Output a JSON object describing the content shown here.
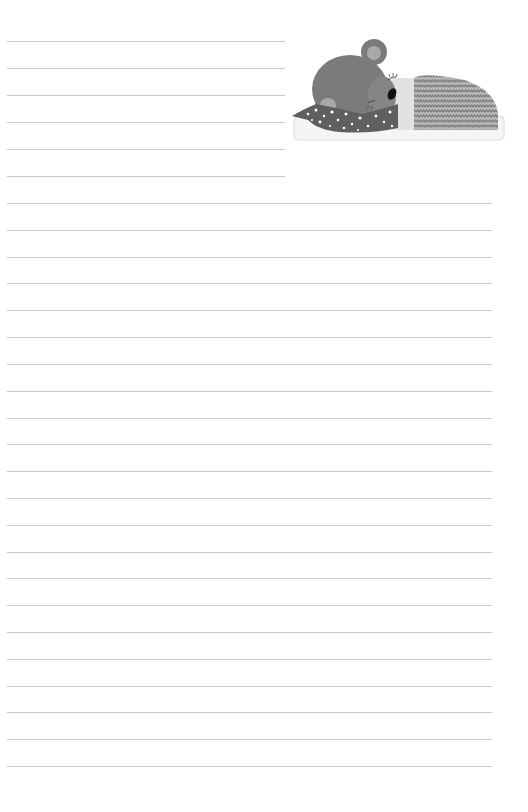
{
  "page": {
    "type": "lined-stationery",
    "background_color": "#ffffff",
    "line_color": "#c9c9c9"
  },
  "short_rules": {
    "count": 6,
    "y_positions": [
      41,
      68,
      95,
      122,
      149,
      176
    ],
    "x_start": 7,
    "x_end": 285
  },
  "full_rules": {
    "count": 22,
    "y_positions": [
      203,
      230,
      257,
      283,
      310,
      337,
      364,
      391,
      418,
      444,
      471,
      498,
      525,
      552,
      578,
      605,
      632,
      659,
      686,
      712,
      739,
      766
    ],
    "x_start": 7,
    "x_end": 492
  },
  "illustration": {
    "subject": "sleeping-bear-icon",
    "description": "Sleeping teddy bear under a zigzag blanket on a pillow",
    "colors": {
      "bear": "#7a7a7a",
      "ear_inner": "#a8a8a8",
      "scarf": "#5e5e5e",
      "scarf_dots": "#ffffff",
      "blanket": "#8c8c8c",
      "blanket_zigzag": "#bdbdbd",
      "sheet": "#e3e3e3",
      "pillow": "#f4f4f4",
      "pillow_border": "#dcdcdc",
      "nose": "#111111"
    }
  }
}
